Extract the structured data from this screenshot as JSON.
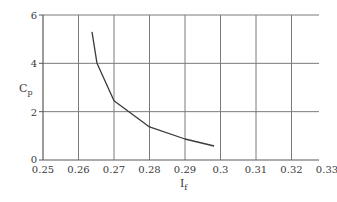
{
  "chart_data": {
    "type": "line",
    "title": "",
    "xlabel": "I_f",
    "ylabel": "C_p",
    "xlabel_main": "I",
    "xlabel_sub": "f",
    "ylabel_main": "C",
    "ylabel_sub": "p",
    "xlim": [
      0.25,
      0.33
    ],
    "ylim": [
      0,
      6
    ],
    "x_ticks": [
      "0.25",
      "0.26",
      "0.27",
      "0.28",
      "0.29",
      "0.3",
      "0.31",
      "0.32",
      "0.33"
    ],
    "x_tick_values": [
      0.25,
      0.26,
      0.27,
      0.28,
      0.29,
      0.3,
      0.31,
      0.32,
      0.33
    ],
    "y_ticks": [
      "0",
      "2",
      "4",
      "6"
    ],
    "y_tick_values": [
      0,
      2,
      4,
      6
    ],
    "grid": true,
    "legend": null,
    "series": [
      {
        "name": "C_p vs I_f",
        "x": [
          0.2638,
          0.2652,
          0.27,
          0.28,
          0.29,
          0.2982
        ],
        "y": [
          5.3,
          4.0,
          2.45,
          1.37,
          0.87,
          0.58
        ]
      }
    ],
    "colors": {
      "line": "#3a3a3a",
      "grid": "#7a7a7a",
      "axis": "#5a5a5a",
      "text": "#3a3a3a"
    }
  }
}
